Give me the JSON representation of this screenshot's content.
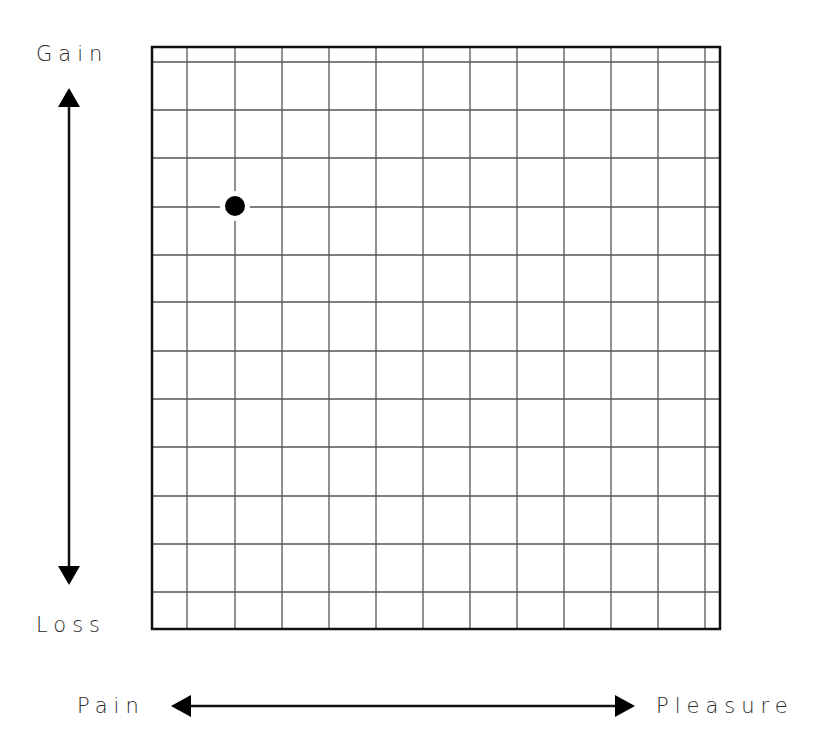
{
  "diagram": {
    "type": "grid-quadrant",
    "axes": {
      "vertical": {
        "top_label": "Gain",
        "bottom_label": "Loss"
      },
      "horizontal": {
        "left_label": "Pain",
        "right_label": "Pleasure"
      }
    },
    "grid": {
      "frame": {
        "x": 152,
        "y": 47,
        "width": 568,
        "height": 582
      },
      "vertical_lines_x": [
        187,
        235,
        282,
        329,
        376,
        423,
        470,
        517,
        564,
        611,
        658,
        705
      ],
      "horizontal_lines_y": [
        62,
        110,
        158,
        207,
        255,
        302,
        351,
        399,
        447,
        496,
        544,
        592
      ],
      "line_color": "#555555",
      "frame_color": "#111111"
    },
    "marker": {
      "cx": 235,
      "cy": 206,
      "r": 10,
      "halo_r": 15,
      "color": "#000000"
    },
    "arrows": {
      "vertical": {
        "x": 69,
        "y_top": 88,
        "y_bottom": 585
      },
      "horizontal": {
        "y": 706,
        "x_left": 171,
        "x_right": 635
      }
    }
  },
  "chart_data": {
    "type": "scatter",
    "title": "",
    "xlabel": "Pain ↔ Pleasure",
    "ylabel": "Loss ↔ Gain",
    "x_axis": {
      "min_label": "Pain",
      "max_label": "Pleasure"
    },
    "y_axis": {
      "min_label": "Loss",
      "max_label": "Gain"
    },
    "grid": true,
    "points": [
      {
        "x_col": 2,
        "y_row_from_top": 4,
        "x_px": 235,
        "y_px": 206
      }
    ]
  }
}
